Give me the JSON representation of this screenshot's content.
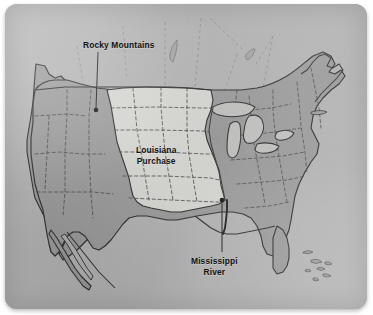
{
  "image": {
    "kind": "historical-map",
    "subject": "Louisiana Purchase map of the United States",
    "width": 373,
    "height": 315
  },
  "card": {
    "background_color": "#b3b3b3",
    "corner_radius_px": 12
  },
  "palette": {
    "background_water": "#b3b3b3",
    "land_other": "#9a9a9a",
    "louisiana_purchase": "#d8d8d4",
    "great_lakes": "#c2c2c0",
    "coastline": "#2b2b2b",
    "state_border_dashed": "#4a4a4a",
    "label_text": "#111111",
    "leader_line": "#1a1a1a"
  },
  "labels": [
    {
      "name": "rocky-mountains",
      "text": "Rocky Mountains",
      "lines": [
        "Rocky Mountains"
      ],
      "x": 78,
      "y": 36,
      "leader": {
        "from_x": 98,
        "from_y": 48,
        "to_x": 96,
        "to_y": 108
      },
      "marker_dot": {
        "x": 96,
        "y": 109,
        "r": 2.3
      }
    },
    {
      "name": "louisiana-purchase",
      "text": "Louisiana Purchase",
      "lines": [
        "Louisiana",
        "Purchase"
      ],
      "x": 131,
      "y": 141,
      "leader": null,
      "marker_dot": null
    },
    {
      "name": "mississippi-river",
      "text": "Mississippi River",
      "lines": [
        "Mississippi",
        "River"
      ],
      "x": 186,
      "y": 252,
      "leader": {
        "from_x": 222,
        "from_y": 249,
        "to_x": 222,
        "to_y": 196
      },
      "marker_dot": {
        "x": 222,
        "y": 195,
        "r": 2.3
      }
    }
  ],
  "regions": [
    {
      "name": "louisiana-purchase-territory",
      "fill": "#d8d8d4",
      "label": "Louisiana Purchase"
    },
    {
      "name": "united-states-existing",
      "fill": "#9a9a9a",
      "label": ""
    },
    {
      "name": "great-lakes",
      "fill": "#c2c2c0",
      "label": ""
    },
    {
      "name": "caribbean-islands",
      "fill": "#9a9a9a",
      "label": ""
    }
  ],
  "features": {
    "mississippi_river": "dark vertical river line running south to the Gulf of Mexico",
    "state_boundaries": "dashed interior state and territory lines",
    "canada_border": "solid line across the north with faint dashed province lines above"
  }
}
